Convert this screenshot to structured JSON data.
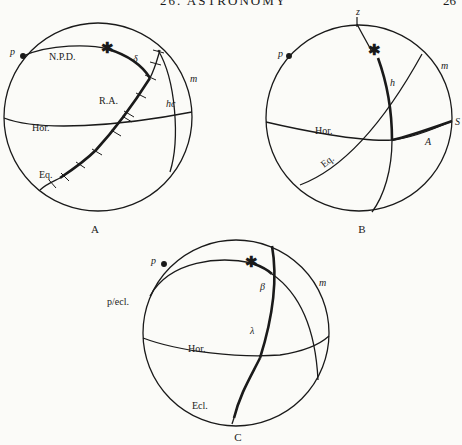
{
  "header": {
    "title": "26. ASTRONOMY",
    "page_number": "26"
  },
  "figures": {
    "A": {
      "caption": "A",
      "labels": {
        "pole": "p",
        "npd": "N.P.D.",
        "delta": "δ",
        "meridian": "m",
        "ra": "R.A.",
        "hour_circle": "hc",
        "horizon": "Hor.",
        "equator": "Eq."
      },
      "icons": {
        "star": "star-icon",
        "pole_point": "pole-dot-icon"
      }
    },
    "B": {
      "caption": "B",
      "labels": {
        "zenith": "z",
        "pole": "p",
        "meridian": "m",
        "altitude": "h",
        "south": "S",
        "horizon": "Hor.",
        "azimuth": "A",
        "equator": "Eq."
      },
      "icons": {
        "star": "star-icon",
        "pole_point": "pole-dot-icon"
      }
    },
    "C": {
      "caption": "C",
      "labels": {
        "pole": "p",
        "pole_ecliptic": "p/ecl.",
        "beta": "β",
        "meridian": "m",
        "lambda": "λ",
        "horizon": "Hor.",
        "ecliptic": "Ecl."
      },
      "icons": {
        "star": "star-icon",
        "pole_point": "pole-dot-icon"
      }
    }
  }
}
